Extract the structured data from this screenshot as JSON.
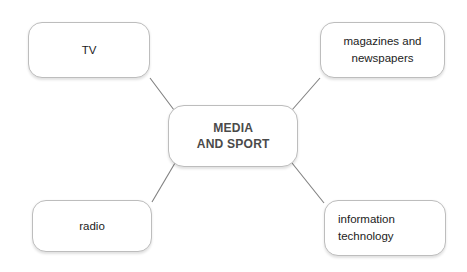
{
  "diagram": {
    "type": "mind-map",
    "title": "MEDIA\nAND SPORT",
    "background_color": "#ffffff",
    "node_border_color": "#bdbdbd",
    "node_text_color": "#1c1c1c",
    "center_text_color": "#4a4a4a",
    "connector_color": "#808080",
    "center": {
      "label": "MEDIA\nAND SPORT"
    },
    "branches": [
      {
        "id": "tv",
        "label": "TV"
      },
      {
        "id": "magazines",
        "label": "magazines and\nnewspapers"
      },
      {
        "id": "radio",
        "label": "radio"
      },
      {
        "id": "infotech",
        "label": "information\ntechnology"
      }
    ],
    "connectors": [
      {
        "from": "center",
        "to": "tv"
      },
      {
        "from": "center",
        "to": "magazines"
      },
      {
        "from": "center",
        "to": "radio"
      },
      {
        "from": "center",
        "to": "infotech"
      }
    ]
  }
}
